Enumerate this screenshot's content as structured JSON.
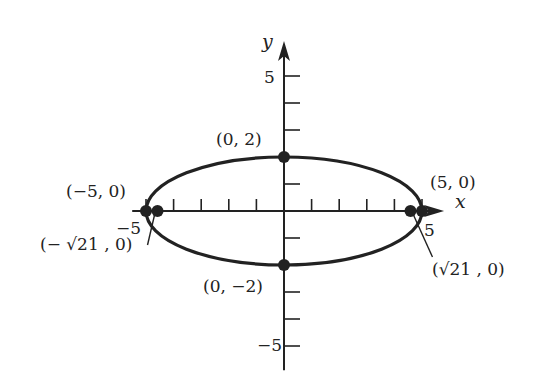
{
  "figure": {
    "type": "ellipse-graph",
    "equation_params": {
      "a": 5,
      "b": 2,
      "c": 4.5826
    },
    "x_axis": {
      "label": "x",
      "range": [
        -5.5,
        5.8
      ],
      "ticks": [
        -5,
        -4,
        -3,
        -2,
        -1,
        1,
        2,
        3,
        4,
        5
      ],
      "tick_labels": {
        "neg": "−5",
        "pos": "5"
      }
    },
    "y_axis": {
      "label": "y",
      "range": [
        -5.9,
        6.3
      ],
      "ticks": [
        -5,
        -4,
        -3,
        -2,
        -1,
        1,
        2,
        3,
        4,
        5
      ],
      "tick_labels": {
        "neg": "−5",
        "pos": "5"
      }
    },
    "points": [
      {
        "id": "vertex-right",
        "x": 5,
        "y": 0,
        "label": "(5, 0)"
      },
      {
        "id": "vertex-left",
        "x": -5,
        "y": 0,
        "label": "(−5, 0)"
      },
      {
        "id": "covertex-top",
        "x": 0,
        "y": 2,
        "label": "(0, 2)"
      },
      {
        "id": "covertex-bottom",
        "x": 0,
        "y": -2,
        "label": "(0, −2)"
      },
      {
        "id": "focus-right",
        "x": 4.5826,
        "y": 0,
        "label": "(√21 , 0)"
      },
      {
        "id": "focus-left",
        "x": -4.5826,
        "y": 0,
        "label": "(− √21 , 0)"
      }
    ],
    "colors": {
      "ink": "#222222",
      "background": "#ffffff"
    }
  }
}
